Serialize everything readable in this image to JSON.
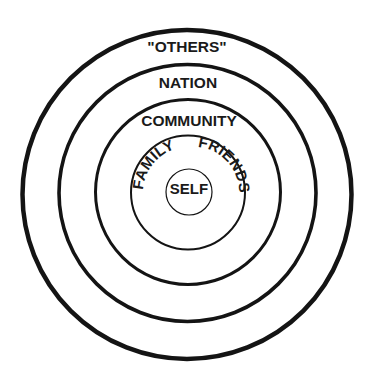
{
  "diagram": {
    "type": "concentric-circles",
    "colors": {
      "stroke": "#141414",
      "text": "#1a1a1a",
      "background": "#ffffff"
    },
    "rings": [
      {
        "id": "others",
        "label": "\"OTHERS\"",
        "level": 5
      },
      {
        "id": "nation",
        "label": "NATION",
        "level": 4
      },
      {
        "id": "community",
        "label": "COMMUNITY",
        "level": 3
      },
      {
        "id": "family-friends",
        "labels": [
          "FAMILY",
          "FRIENDS"
        ],
        "level": 2
      },
      {
        "id": "self",
        "label": "SELF",
        "level": 1
      }
    ]
  }
}
